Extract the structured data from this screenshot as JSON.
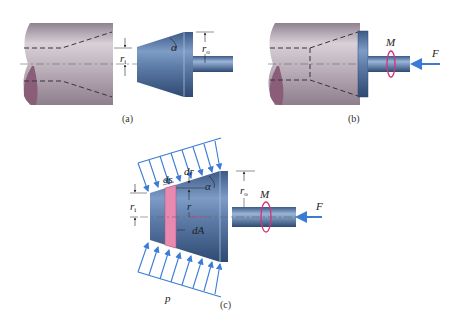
{
  "figure": {
    "panels": [
      {
        "id": "a",
        "caption": "(a)",
        "labels": {
          "r_inner": "r",
          "r_inner_sub": "i",
          "r_outer": "r",
          "r_outer_sub": "o",
          "angle": "α"
        }
      },
      {
        "id": "b",
        "caption": "(b)",
        "labels": {
          "moment": "M",
          "force": "F"
        }
      },
      {
        "id": "c",
        "caption": "(c)",
        "labels": {
          "r_inner": "r",
          "r_inner_sub": "i",
          "r_outer": "r",
          "r_outer_sub": "o",
          "angle": "α",
          "ds": "ds",
          "dr": "dr",
          "r": "r",
          "dA": "dA",
          "pressure": "p",
          "moment": "M",
          "force": "F"
        }
      }
    ],
    "colors": {
      "housing": "#b7a8b4",
      "cone": "#5a7aa8",
      "arrows": "#3a7bd5",
      "moment": "#d4327a",
      "strip": "#e889b0"
    }
  }
}
